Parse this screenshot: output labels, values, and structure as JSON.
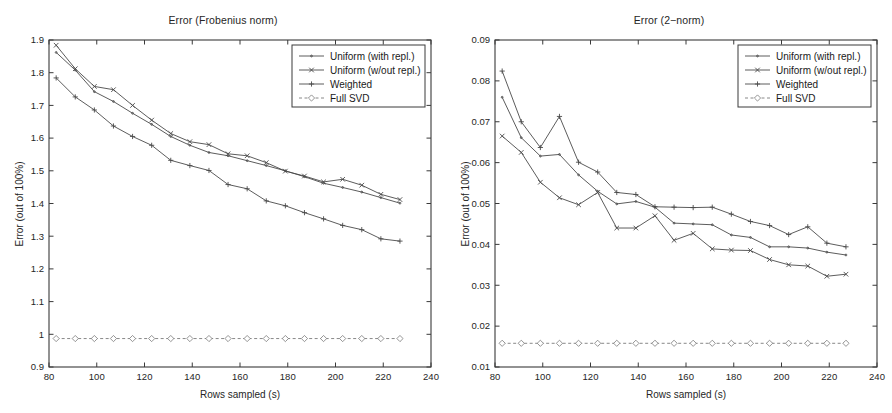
{
  "figure": {
    "width": 892,
    "height": 413,
    "background": "#ffffff",
    "axis_color": "#3a3a3a",
    "curve_color": "#4a4a4a"
  },
  "chart_data": [
    {
      "type": "line",
      "panel": "left",
      "title": "Error (Frobenius norm)",
      "xlabel": "Rows sampled (s)",
      "ylabel": "Error (out of 100%)",
      "xlim": [
        80,
        240
      ],
      "ylim": [
        0.9,
        1.9
      ],
      "xticks": [
        80,
        100,
        120,
        140,
        160,
        180,
        200,
        220,
        240
      ],
      "xticklabels": [
        "80",
        "100",
        "120",
        "140",
        "160",
        "180",
        "200",
        "220",
        "240"
      ],
      "yticks": [
        0.9,
        1.0,
        1.1,
        1.2,
        1.3,
        1.4,
        1.5,
        1.6,
        1.7,
        1.8,
        1.9
      ],
      "yticklabels": [
        "0.9",
        "1",
        "1.1",
        "1.2",
        "1.3",
        "1.4",
        "1.5",
        "1.6",
        "1.7",
        "1.8",
        "1.9"
      ],
      "grid": false,
      "legend_position": "upper right",
      "x": [
        83,
        91,
        99,
        107,
        115,
        123,
        131,
        139,
        147,
        155,
        163,
        171,
        179,
        187,
        195,
        203,
        211,
        219,
        227
      ],
      "series": [
        {
          "name": "Uniform (with repl.)",
          "marker": "dot",
          "values": [
            1.862,
            1.808,
            1.742,
            1.712,
            1.676,
            1.642,
            1.605,
            1.578,
            1.556,
            1.546,
            1.531,
            1.516,
            1.5,
            1.482,
            1.462,
            1.449,
            1.435,
            1.418,
            1.401
          ]
        },
        {
          "name": "Uniform (w/out repl.)",
          "marker": "x",
          "values": [
            1.884,
            1.812,
            1.758,
            1.748,
            1.7,
            1.655,
            1.614,
            1.589,
            1.58,
            1.552,
            1.546,
            1.525,
            1.499,
            1.484,
            1.466,
            1.474,
            1.456,
            1.428,
            1.412
          ]
        },
        {
          "name": "Weighted",
          "marker": "plus",
          "values": [
            1.784,
            1.726,
            1.686,
            1.637,
            1.605,
            1.578,
            1.532,
            1.516,
            1.501,
            1.458,
            1.445,
            1.408,
            1.393,
            1.372,
            1.353,
            1.333,
            1.32,
            1.292,
            1.285
          ]
        },
        {
          "name": "Full SVD",
          "marker": "diamond",
          "values": [
            0.987,
            0.987,
            0.987,
            0.987,
            0.987,
            0.987,
            0.987,
            0.987,
            0.987,
            0.987,
            0.987,
            0.987,
            0.987,
            0.987,
            0.987,
            0.987,
            0.987,
            0.987,
            0.987
          ]
        }
      ]
    },
    {
      "type": "line",
      "panel": "right",
      "title": "Error (2−norm)",
      "xlabel": "Rows sampled (s)",
      "ylabel": "Error (out of 100%)",
      "xlim": [
        80,
        240
      ],
      "ylim": [
        0.01,
        0.09
      ],
      "xticks": [
        80,
        100,
        120,
        140,
        160,
        180,
        200,
        220,
        240
      ],
      "xticklabels": [
        "80",
        "100",
        "120",
        "140",
        "160",
        "180",
        "200",
        "220",
        "240"
      ],
      "yticks": [
        0.01,
        0.02,
        0.03,
        0.04,
        0.05,
        0.06,
        0.07,
        0.08,
        0.09
      ],
      "yticklabels": [
        "0.01",
        "0.02",
        "0.03",
        "0.04",
        "0.05",
        "0.06",
        "0.07",
        "0.08",
        "0.09"
      ],
      "grid": false,
      "legend_position": "upper right",
      "x": [
        83,
        91,
        99,
        107,
        115,
        123,
        131,
        139,
        147,
        155,
        163,
        171,
        179,
        187,
        195,
        203,
        211,
        219,
        227
      ],
      "series": [
        {
          "name": "Uniform (with repl.)",
          "marker": "dot",
          "values": [
            0.076,
            0.0661,
            0.0616,
            0.062,
            0.057,
            0.053,
            0.0499,
            0.0505,
            0.0491,
            0.0452,
            0.045,
            0.0448,
            0.0423,
            0.0417,
            0.0394,
            0.0394,
            0.0391,
            0.0381,
            0.0374
          ]
        },
        {
          "name": "Uniform (w/out repl.)",
          "marker": "x",
          "values": [
            0.0665,
            0.0625,
            0.0552,
            0.0514,
            0.0497,
            0.0527,
            0.044,
            0.044,
            0.047,
            0.041,
            0.0427,
            0.0389,
            0.0386,
            0.0385,
            0.0363,
            0.035,
            0.0347,
            0.0322,
            0.0327
          ]
        },
        {
          "name": "Weighted",
          "marker": "plus",
          "values": [
            0.0824,
            0.07,
            0.0637,
            0.0713,
            0.0601,
            0.0577,
            0.0527,
            0.0522,
            0.0492,
            0.0491,
            0.049,
            0.0491,
            0.0474,
            0.0456,
            0.0446,
            0.0424,
            0.0443,
            0.0403,
            0.0394
          ]
        },
        {
          "name": "Full SVD",
          "marker": "diamond",
          "values": [
            0.0158,
            0.0158,
            0.0158,
            0.0158,
            0.0158,
            0.0158,
            0.0158,
            0.0158,
            0.0158,
            0.0158,
            0.0158,
            0.0158,
            0.0158,
            0.0158,
            0.0158,
            0.0158,
            0.0158,
            0.0158,
            0.0158
          ]
        }
      ]
    }
  ]
}
